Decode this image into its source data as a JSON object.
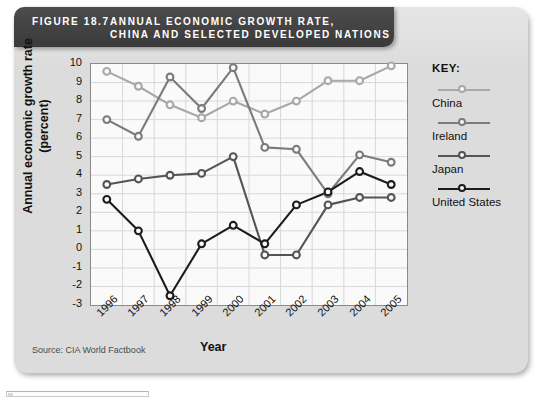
{
  "figure": {
    "number_label": "FIGURE 18.7",
    "title_line1": "ANNUAL ECONOMIC GROWTH RATE,",
    "title_line2": "CHINA AND SELECTED DEVELOPED NATIONS",
    "source": "Source: CIA World Factbook"
  },
  "legend": {
    "title": "KEY:",
    "entries": [
      {
        "label": "China",
        "color": "#a8a8a8"
      },
      {
        "label": "Ireland",
        "color": "#7b7b7b"
      },
      {
        "label": "Japan",
        "color": "#545454"
      },
      {
        "label": "United States",
        "color": "#1c1c1c"
      }
    ]
  },
  "chart_data": {
    "type": "line",
    "title": "Annual Economic Growth Rate, China and Selected Developed Nations",
    "xlabel": "Year",
    "ylabel": "Annual economic growth rate (percent)",
    "ylabel_line1": "Annual economic growth rate",
    "ylabel_line2": "(percent)",
    "categories": [
      "1996",
      "1997",
      "1998",
      "1999",
      "2000",
      "2001",
      "2002",
      "2003",
      "2004",
      "2005"
    ],
    "x": [
      1996,
      1997,
      1998,
      1999,
      2000,
      2001,
      2002,
      2003,
      2004,
      2005
    ],
    "ylim": [
      -3,
      10
    ],
    "yticks": [
      10,
      9,
      8,
      7,
      6,
      5,
      4,
      3,
      2,
      1,
      0,
      -1,
      -2,
      -3
    ],
    "grid": true,
    "legend_position": "right",
    "series": [
      {
        "name": "China",
        "color": "#a8a8a8",
        "values": [
          9.6,
          8.8,
          7.8,
          7.1,
          8.0,
          7.3,
          8.0,
          9.1,
          9.1,
          9.9
        ]
      },
      {
        "name": "Ireland",
        "color": "#7b7b7b",
        "values": [
          7.0,
          6.1,
          9.3,
          7.6,
          9.8,
          5.5,
          5.4,
          3.0,
          5.1,
          4.7
        ]
      },
      {
        "name": "Japan",
        "color": "#545454",
        "values": [
          3.5,
          3.8,
          4.0,
          4.1,
          5.0,
          -0.3,
          -0.3,
          2.4,
          2.8,
          2.8
        ]
      },
      {
        "name": "United States",
        "color": "#1c1c1c",
        "values": [
          2.7,
          1.0,
          -2.5,
          0.3,
          1.3,
          0.3,
          2.4,
          3.1,
          4.2,
          3.5
        ]
      }
    ]
  }
}
